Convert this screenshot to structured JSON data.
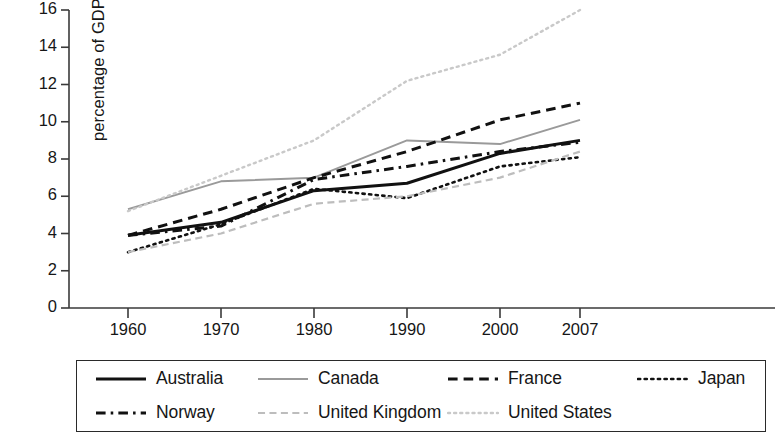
{
  "chart_data": {
    "type": "line",
    "title": "",
    "subtitle": "",
    "xlabel": "",
    "ylabel": "percentage of GDP",
    "x": [
      1960,
      1970,
      1980,
      1990,
      2000,
      2007
    ],
    "categories": [
      "1960",
      "1970",
      "1980",
      "1990",
      "2000",
      "2007"
    ],
    "xtick_labels": [
      "1960",
      "1970",
      "1980",
      "1990",
      "2000",
      "2007"
    ],
    "ytick_labels": [
      "0",
      "2",
      "4",
      "6",
      "8",
      "10",
      "12",
      "14",
      "16"
    ],
    "ytick_values": [
      0,
      2,
      4,
      6,
      8,
      10,
      12,
      14,
      16
    ],
    "ylim": [
      0,
      16
    ],
    "grid": false,
    "legend_position": "bottom",
    "series": [
      {
        "name": "Australia",
        "values": [
          3.9,
          4.6,
          6.3,
          6.7,
          8.3,
          9.0
        ],
        "color": "#111111",
        "style": "solid",
        "width": 3.0
      },
      {
        "name": "Canada",
        "values": [
          5.3,
          6.8,
          7.0,
          9.0,
          8.8,
          10.1
        ],
        "color": "#9a9a9a",
        "style": "solid",
        "width": 2.0
      },
      {
        "name": "France",
        "values": [
          3.9,
          5.3,
          7.0,
          8.4,
          10.1,
          11.0
        ],
        "color": "#111111",
        "style": "dashed",
        "width": 3.0
      },
      {
        "name": "Japan",
        "values": [
          3.0,
          4.5,
          6.4,
          5.9,
          7.6,
          8.1
        ],
        "color": "#111111",
        "style": "dotted",
        "width": 2.6
      },
      {
        "name": "Norway",
        "values": [
          3.9,
          4.4,
          6.9,
          7.6,
          8.4,
          8.9
        ],
        "color": "#111111",
        "style": "dashdot",
        "width": 3.0
      },
      {
        "name": "United Kingdom",
        "values": [
          3.0,
          4.0,
          5.6,
          6.0,
          7.0,
          8.4
        ],
        "color": "#bdbdbd",
        "style": "dashed",
        "width": 2.2
      },
      {
        "name": "United States",
        "values": [
          5.2,
          7.1,
          9.0,
          12.2,
          13.6,
          16.0
        ],
        "color": "#c9c9c9",
        "style": "dotted",
        "width": 2.4
      }
    ]
  },
  "legend": {
    "rows": [
      [
        {
          "label": "Australia",
          "series": "Australia"
        },
        {
          "label": "Canada",
          "series": "Canada"
        },
        {
          "label": "France",
          "series": "France"
        },
        {
          "label": "Japan",
          "series": "Japan"
        }
      ],
      [
        {
          "label": "Norway",
          "series": "Norway"
        },
        {
          "label": "United Kingdom",
          "series": "United Kingdom"
        },
        {
          "label": "United States",
          "series": "United States"
        }
      ]
    ]
  },
  "axis": {
    "color": "#3a3a3a"
  }
}
